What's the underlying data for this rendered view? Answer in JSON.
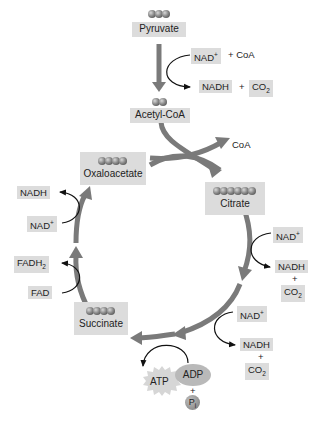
{
  "diagram": {
    "type": "citric-acid-cycle",
    "colors": {
      "box_fill": "#dcdcdc",
      "main_arrow": "#7a7a7a",
      "side_arrow": "#111111",
      "atp_fill": "#d6d6d6",
      "adp_fill": "#b9b9b9"
    },
    "pyruvate": {
      "label": "Pyruvate",
      "carbons": 3
    },
    "acetyl_coa": {
      "label": "Acetyl-CoA",
      "carbons": 2
    },
    "pdh_inputs": {
      "nad": "NAD",
      "nad_sup": "+",
      "plus_coa": "+ CoA"
    },
    "pdh_outputs": {
      "nadh": "NADH",
      "plus": "+",
      "co2": "CO",
      "co2_sub": "2"
    },
    "coa_release": "CoA",
    "oxaloacetate": {
      "label": "Oxaloacetate",
      "carbons": 4
    },
    "citrate": {
      "label": "Citrate",
      "carbons": 6
    },
    "succinate": {
      "label": "Succinate",
      "carbons": 4
    },
    "step1": {
      "nad": "NAD",
      "nad_sup": "+",
      "nadh": "NADH",
      "plus": "+",
      "co2": "CO",
      "co2_sub": "2"
    },
    "step2": {
      "nad": "NAD",
      "nad_sup": "+",
      "nadh": "NADH",
      "plus": "+",
      "co2": "CO",
      "co2_sub": "2"
    },
    "atp_step": {
      "adp": "ADP",
      "plus": "+",
      "pi": "P",
      "pi_sub": "i",
      "atp": "ATP"
    },
    "fad_step": {
      "fad": "FAD",
      "fadh": "FADH",
      "fadh_sub": "2"
    },
    "nad_step_left": {
      "nad": "NAD",
      "nad_sup": "+",
      "nadh": "NADH"
    }
  }
}
